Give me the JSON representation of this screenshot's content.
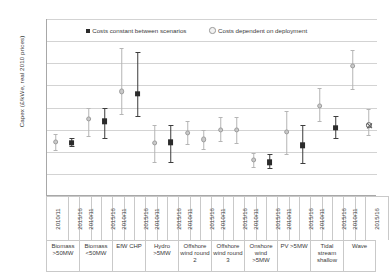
{
  "chart_data": {
    "type": "scatter",
    "title": "",
    "xlabel": "",
    "ylabel": "Capex (£/kWe, real 2010 prices)",
    "ylim": [
      0,
      8000
    ],
    "ytick_step": 1000,
    "ytick_labels": [
      "8,000",
      "7,000",
      "6,000",
      "5,000",
      "4,000",
      "3,000",
      "2,000",
      "1,000",
      "0"
    ],
    "grid": true,
    "legend_position": "top-inside",
    "legend": [
      {
        "key": "constant",
        "label": "Costs constant between scenarios",
        "marker": "filled-square",
        "color": "#2b2b2b"
      },
      {
        "key": "dependent",
        "label": "Costs dependent on deployment",
        "marker": "open-circle",
        "color": "#b5b5b5"
      }
    ],
    "year_labels": [
      "2010/11",
      "2015/16"
    ],
    "categories": [
      "Biomass >50MW",
      "Biomass <50MW",
      "EfW CHP",
      "Hydro >5MW",
      "Offshore wind round 2",
      "Offshore wind round 3",
      "Onshore wind >5MW",
      "PV >5MW",
      "Tidal stream shallow",
      "Wave"
    ],
    "category_lines": [
      [
        "Biomass",
        ">50MW"
      ],
      [
        "Biomass",
        "<50MW"
      ],
      [
        "EfW CHP"
      ],
      [
        "Hydro",
        ">5MW"
      ],
      [
        "Offshore",
        "wind round",
        "2"
      ],
      [
        "Offshore",
        "wind round",
        "3"
      ],
      [
        "Onshore",
        "wind",
        ">5MW"
      ],
      [
        "PV >5MW"
      ],
      [
        "Tidal",
        "stream",
        "shallow"
      ],
      [
        "Wave"
      ]
    ],
    "points": [
      {
        "category": "Biomass >50MW",
        "year": "2010/11",
        "series": "dependent",
        "value": 2450,
        "low": 2100,
        "high": 2800
      },
      {
        "category": "Biomass >50MW",
        "year": "2015/16",
        "series": "constant",
        "value": 2400,
        "low": 2250,
        "high": 2600
      },
      {
        "category": "Biomass <50MW",
        "year": "2010/11",
        "series": "dependent",
        "value": 3480,
        "low": 2700,
        "high": 4000
      },
      {
        "category": "Biomass <50MW",
        "year": "2015/16",
        "series": "constant",
        "value": 3370,
        "low": 2600,
        "high": 4000
      },
      {
        "category": "EfW CHP",
        "year": "2010/11",
        "series": "dependent",
        "value": 4730,
        "low": 3700,
        "high": 6700
      },
      {
        "category": "EfW CHP",
        "year": "2015/16",
        "series": "constant",
        "value": 4620,
        "low": 3630,
        "high": 6500
      },
      {
        "category": "Hydro >5MW",
        "year": "2010/11",
        "series": "dependent",
        "value": 2400,
        "low": 1530,
        "high": 3200
      },
      {
        "category": "Hydro >5MW",
        "year": "2015/16",
        "series": "constant",
        "value": 2420,
        "low": 1520,
        "high": 3200
      },
      {
        "category": "Offshore wind round 2",
        "year": "2010/11",
        "series": "dependent",
        "value": 2840,
        "low": 2330,
        "high": 3400
      },
      {
        "category": "Offshore wind round 2",
        "year": "2015/16",
        "series": "dependent",
        "value": 2560,
        "low": 2130,
        "high": 3000
      },
      {
        "category": "Offshore wind round 3",
        "year": "2010/11",
        "series": "dependent",
        "value": 3000,
        "low": 2480,
        "high": 3550
      },
      {
        "category": "Offshore wind round 3",
        "year": "2015/16",
        "series": "dependent",
        "value": 2980,
        "low": 2400,
        "high": 3580
      },
      {
        "category": "Onshore wind >5MW",
        "year": "2010/11",
        "series": "dependent",
        "value": 1620,
        "low": 1320,
        "high": 1960
      },
      {
        "category": "Onshore wind >5MW",
        "year": "2015/16",
        "series": "constant",
        "value": 1520,
        "low": 1260,
        "high": 1900
      },
      {
        "category": "PV >5MW",
        "year": "2010/11",
        "series": "dependent",
        "value": 2900,
        "low": 1900,
        "high": 3850
      },
      {
        "category": "PV >5MW",
        "year": "2015/16",
        "series": "constant",
        "value": 2300,
        "low": 1500,
        "high": 3200
      },
      {
        "category": "Tidal stream shallow",
        "year": "2010/11",
        "series": "dependent",
        "value": 4080,
        "low": 3380,
        "high": 4900
      },
      {
        "category": "Tidal stream shallow",
        "year": "2015/16",
        "series": "constant",
        "value": 3080,
        "low": 2620,
        "high": 3620
      },
      {
        "category": "Wave",
        "year": "2010/11",
        "series": "dependent",
        "value": 5880,
        "low": 4850,
        "high": 6600
      },
      {
        "category": "Wave",
        "year": "2015/16",
        "series": "dependent-open",
        "value": 3200,
        "low": 2760,
        "high": 3950
      }
    ]
  }
}
